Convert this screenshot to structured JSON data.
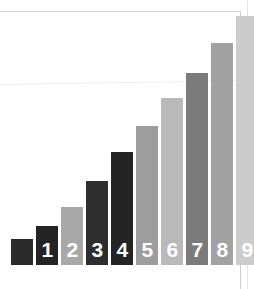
{
  "figure": {
    "background_color": "#ffffff",
    "page_edge_color": "#d2d2d2",
    "label_color": "#ffffff",
    "baseline_y": 265,
    "width": 254,
    "height": 289
  },
  "chart_data": {
    "type": "bar",
    "title": "",
    "subtitle": "",
    "xlabel": "",
    "ylabel": "",
    "grid": false,
    "legend": "none",
    "xlim": [
      0,
      10
    ],
    "ylim": [
      0,
      10
    ],
    "categories": [
      "",
      "1",
      "2",
      "3",
      "4",
      "5",
      "6",
      "7",
      "8",
      "9"
    ],
    "values": [
      1,
      2,
      3,
      4,
      5,
      6,
      7,
      8,
      9,
      10
    ],
    "tick_labels": [
      "",
      "1",
      "2",
      "3",
      "4",
      "5",
      "6",
      "7",
      "8",
      "9"
    ],
    "annotations": [],
    "bars": [
      {
        "index": 0,
        "label": "",
        "value": 1,
        "color": "#2b2b2b",
        "x": 11,
        "width": 22,
        "top": 239,
        "height": 26
      },
      {
        "index": 1,
        "label": "1",
        "value": 2,
        "color": "#242424",
        "x": 36,
        "width": 22,
        "top": 226,
        "height": 39
      },
      {
        "index": 2,
        "label": "2",
        "value": 3,
        "color": "#a8a8a8",
        "x": 61,
        "width": 22,
        "top": 207,
        "height": 58
      },
      {
        "index": 3,
        "label": "3",
        "value": 4,
        "color": "#2e2e2e",
        "x": 86,
        "width": 22,
        "top": 181,
        "height": 84
      },
      {
        "index": 4,
        "label": "4",
        "value": 5,
        "color": "#242424",
        "x": 111,
        "width": 22,
        "top": 152,
        "height": 113
      },
      {
        "index": 5,
        "label": "5",
        "value": 6,
        "color": "#9d9d9d",
        "x": 136,
        "width": 22,
        "top": 126,
        "height": 139
      },
      {
        "index": 6,
        "label": "6",
        "value": 7,
        "color": "#b9b9b9",
        "x": 161,
        "width": 22,
        "top": 98,
        "height": 167
      },
      {
        "index": 7,
        "label": "7",
        "value": 8,
        "color": "#7b7b7b",
        "x": 186,
        "width": 22,
        "top": 73,
        "height": 192
      },
      {
        "index": 8,
        "label": "8",
        "value": 9,
        "color": "#a2a2a2",
        "x": 211,
        "width": 22,
        "top": 43,
        "height": 222
      },
      {
        "index": 9,
        "label": "9",
        "value": 10,
        "color": "#cccccc",
        "x": 236,
        "width": 22,
        "top": 16,
        "height": 249
      }
    ]
  }
}
